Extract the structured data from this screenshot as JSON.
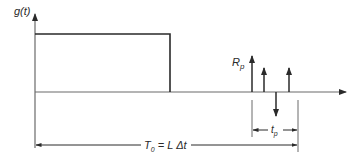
{
  "diagram": {
    "type": "signal-timing-diagram",
    "y_axis_label": "g(t)",
    "pulse_label": "R",
    "pulse_label_sub": "p",
    "tp_label": "t",
    "tp_label_sub": "p",
    "period_label_T": "T",
    "period_label_T_sub": "0",
    "period_label_rest": " = L Δt",
    "colors": {
      "line": "#2a2a2a",
      "axis": "#6a6a6a",
      "background": "#ffffff"
    },
    "elements": {
      "rectangular_pulse": {
        "x_start": 35,
        "x_end": 170,
        "top": 34,
        "baseline": 92
      },
      "impulses": [
        {
          "x": 252,
          "direction": "up",
          "tip": 56
        },
        {
          "x": 264,
          "direction": "up",
          "tip": 68
        },
        {
          "x": 276,
          "direction": "down",
          "tip": 116
        },
        {
          "x": 289,
          "direction": "up",
          "tip": 68
        }
      ],
      "tp_span": {
        "x_start": 252,
        "x_end": 298,
        "y": 130
      },
      "T0_span": {
        "x_start": 35,
        "x_end": 298,
        "y": 145
      }
    }
  }
}
